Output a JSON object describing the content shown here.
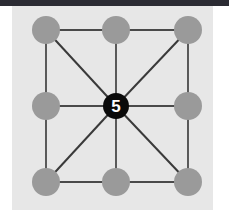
{
  "canvas": {
    "width": 229,
    "height": 223,
    "background": "#ffffff",
    "top_bar_color": "#2b2b33",
    "top_bar_height": 6,
    "panel": {
      "x": 12,
      "y": 6,
      "width": 201,
      "height": 204,
      "color": "#e7e7e7"
    }
  },
  "graph": {
    "title": "3x3 grid graph with highlighted center node",
    "node_fill": "#9a9a9a",
    "node_radius": 14,
    "highlight_fill": "#0a0a0a",
    "highlight_radius": 13,
    "highlight_text_color": "#ffffff",
    "edge_color": "#4a4a4a",
    "edge_width": 1.8,
    "diagonal_color": "#3a3a3a",
    "diagonal_width": 2.0,
    "nodes": [
      {
        "id": "1",
        "label": "",
        "x": 46,
        "y": 30,
        "highlighted": false,
        "name": "node-top-left"
      },
      {
        "id": "2",
        "label": "",
        "x": 116,
        "y": 30,
        "highlighted": false,
        "name": "node-top-center"
      },
      {
        "id": "3",
        "label": "",
        "x": 188,
        "y": 30,
        "highlighted": false,
        "name": "node-top-right"
      },
      {
        "id": "4",
        "label": "",
        "x": 46,
        "y": 106,
        "highlighted": false,
        "name": "node-middle-left"
      },
      {
        "id": "5",
        "label": "5",
        "x": 116,
        "y": 106,
        "highlighted": true,
        "name": "node-center"
      },
      {
        "id": "6",
        "label": "",
        "x": 188,
        "y": 106,
        "highlighted": false,
        "name": "node-middle-right"
      },
      {
        "id": "7",
        "label": "",
        "x": 46,
        "y": 182,
        "highlighted": false,
        "name": "node-bottom-left"
      },
      {
        "id": "8",
        "label": "",
        "x": 116,
        "y": 182,
        "highlighted": false,
        "name": "node-bottom-center"
      },
      {
        "id": "9",
        "label": "",
        "x": 188,
        "y": 182,
        "highlighted": false,
        "name": "node-bottom-right"
      }
    ],
    "edges": [
      {
        "from": "1",
        "to": "2",
        "kind": "orthogonal"
      },
      {
        "from": "2",
        "to": "3",
        "kind": "orthogonal"
      },
      {
        "from": "4",
        "to": "5",
        "kind": "orthogonal"
      },
      {
        "from": "5",
        "to": "6",
        "kind": "orthogonal"
      },
      {
        "from": "7",
        "to": "8",
        "kind": "orthogonal"
      },
      {
        "from": "8",
        "to": "9",
        "kind": "orthogonal"
      },
      {
        "from": "1",
        "to": "4",
        "kind": "orthogonal"
      },
      {
        "from": "4",
        "to": "7",
        "kind": "orthogonal"
      },
      {
        "from": "2",
        "to": "5",
        "kind": "orthogonal"
      },
      {
        "from": "5",
        "to": "8",
        "kind": "orthogonal"
      },
      {
        "from": "3",
        "to": "6",
        "kind": "orthogonal"
      },
      {
        "from": "6",
        "to": "9",
        "kind": "orthogonal"
      },
      {
        "from": "5",
        "to": "1",
        "kind": "diagonal"
      },
      {
        "from": "5",
        "to": "3",
        "kind": "diagonal"
      },
      {
        "from": "5",
        "to": "7",
        "kind": "diagonal"
      },
      {
        "from": "5",
        "to": "9",
        "kind": "diagonal"
      }
    ]
  }
}
